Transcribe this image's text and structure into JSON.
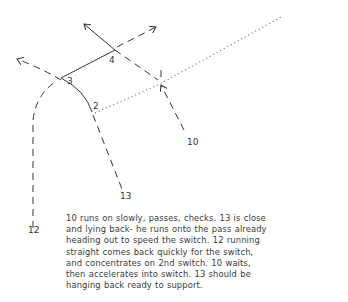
{
  "diagram": {
    "players": [
      {
        "id": "10",
        "label": "10"
      },
      {
        "id": "12",
        "label": "12"
      },
      {
        "id": "13",
        "label": "13"
      }
    ],
    "pass_points": [
      {
        "id": "2",
        "label": "2"
      },
      {
        "id": "3",
        "label": "3"
      },
      {
        "id": "4",
        "label": "4"
      }
    ],
    "line_legend": {
      "solid": "pass / ball path",
      "dashed": "player run",
      "dotted": "ball direction continuation"
    },
    "colors": {
      "ink": "#333333",
      "background": "#ffffff"
    }
  },
  "caption": {
    "lines": [
      "10 runs on slowly, passes, checks. 13 is close",
      "and lying back- he runs onto the pass already",
      "heading out to speed the switch. 12 running",
      "straight comes back quickly for the switch,",
      "and concentrates on 2nd switch. 10 waits,",
      "then accelerates into switch. 13 should be",
      "hanging back ready to support."
    ]
  }
}
